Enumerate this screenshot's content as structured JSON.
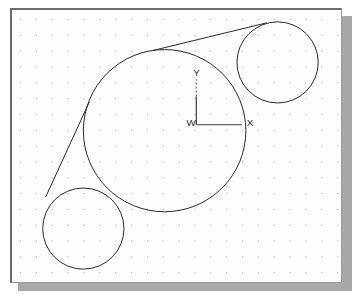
{
  "app": {
    "title": "CAD Drawing Area",
    "description": "Model space viewport showing three mutually tangent circles joined by two external tangent lines"
  },
  "canvas": {
    "background_color": "#fdfdfd",
    "shadow_color": "#a8a8a8",
    "border_color": "#6b6b6b",
    "width": 332,
    "height": 275
  },
  "grid": {
    "visible": true,
    "dot_spacing": 16,
    "dot_color": "#b9b9c6",
    "origin_x": 8,
    "origin_y": 9
  },
  "geometry": {
    "stroke_color": "#2b2b2b",
    "circles": [
      {
        "name": "large-center-circle",
        "cx": 154,
        "cy": 122,
        "r": 82
      },
      {
        "name": "upper-right-circle",
        "cx": 268,
        "cy": 53,
        "r": 41
      },
      {
        "name": "lower-left-circle",
        "cx": 72,
        "cy": 221,
        "r": 41
      }
    ],
    "lines": [
      {
        "name": "upper-tangent-line",
        "x1": 142,
        "y1": 41,
        "x2": 257,
        "y2": 13
      },
      {
        "name": "left-tangent-line",
        "x1": 78,
        "y1": 93,
        "x2": 34,
        "y2": 189
      }
    ]
  },
  "ucs_icon": {
    "name": "wcs-coordinate-icon",
    "origin_x": 186,
    "origin_y": 116,
    "x_axis_length": 46,
    "y_axis_length": 46,
    "labels": {
      "origin": "W",
      "x_axis": "X",
      "y_axis": "Y"
    }
  }
}
